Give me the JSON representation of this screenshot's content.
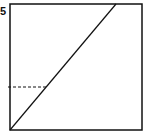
{
  "diagram": {
    "corner_label": "5",
    "line_color": "#111111",
    "frame": {
      "x": 10,
      "y": 4,
      "w": 132,
      "h": 126
    },
    "diagonal": {
      "x1": 10,
      "y1": 130,
      "x2": 116,
      "y2": 4
    },
    "dashed_guide": {
      "x1": 8,
      "y1": 87,
      "x2": 46,
      "y2": 87
    }
  }
}
